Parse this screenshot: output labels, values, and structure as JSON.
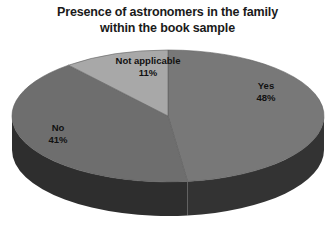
{
  "chart_data": {
    "type": "pie",
    "title": "Presence of astronomers in the family within the book sample",
    "title_lines": [
      "Presence of astronomers in the family",
      "within the book sample"
    ],
    "categories": [
      "Yes",
      "No",
      "Not applicable"
    ],
    "values": [
      48,
      41,
      11
    ],
    "value_labels": [
      "48%",
      "41%",
      "11%"
    ],
    "units": "percent",
    "xlabel": "",
    "ylabel": "",
    "legend": "none",
    "grid": false,
    "three_d": true,
    "start_angle_deg": 0,
    "direction": "clockwise",
    "colors": {
      "yes": "#787878",
      "no": "#6e6e6e",
      "not_applicable": "#a8a8a8",
      "yes_side": "#333333",
      "no_side": "#2e2e2e",
      "background": "#ffffff",
      "title_text": "#1a1a1a",
      "label_text": "#111111"
    },
    "slices": [
      {
        "name": "Yes",
        "value": 48,
        "label": "48%",
        "color": "#787878"
      },
      {
        "name": "No",
        "value": 41,
        "label": "41%",
        "color": "#6e6e6e"
      },
      {
        "name": "Not applicable",
        "value": 11,
        "label": "11%",
        "color": "#a8a8a8"
      }
    ]
  }
}
